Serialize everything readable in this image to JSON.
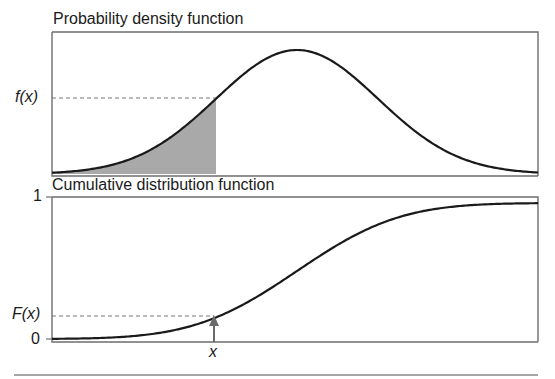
{
  "chart_data": [
    {
      "type": "area",
      "title": "Probability density function",
      "xlabel": "",
      "ylabel": "",
      "annotations": [
        "f(x)"
      ],
      "description": "Bell-shaped normal density curve with the area under the curve to the left of x shaded grey; dashed horizontal line marks f(x) at the boundary.",
      "distribution": {
        "kind": "normal",
        "mean": 0,
        "sd": 1
      },
      "x_range": [
        -3,
        3
      ],
      "shaded_region": {
        "from": -3,
        "to": -1.0
      },
      "marked_point": {
        "x": -1.0,
        "y_label": "f(x)"
      },
      "grid": false
    },
    {
      "type": "line",
      "title": "Cumulative distribution function",
      "xlabel": "x",
      "ylabel": "",
      "yticks": [
        "0",
        "1"
      ],
      "ylim": [
        0,
        1
      ],
      "annotations": [
        "F(x)",
        "x"
      ],
      "description": "S-shaped cumulative distribution curve rising from 0 to 1; an arrow at x points up to the curve and a dashed line marks F(x).",
      "distribution": {
        "kind": "normal",
        "mean": 0,
        "sd": 1
      },
      "x_range": [
        -3,
        3
      ],
      "marked_point": {
        "x": -1.0,
        "y": 0.17,
        "y_label": "F(x)"
      },
      "grid": false
    }
  ],
  "labels": {
    "pdf_title": "Probability density function",
    "cdf_title": "Cumulative distribution function",
    "fx": "f(x)",
    "Fx": "F(x)",
    "x": "x",
    "one": "1",
    "zero": "0"
  },
  "colors": {
    "curve": "#1a1a1a",
    "shade": "#a9a9a9",
    "frame": "#6e6e6e",
    "dash": "#777777",
    "arrow": "#6a6a6a"
  }
}
